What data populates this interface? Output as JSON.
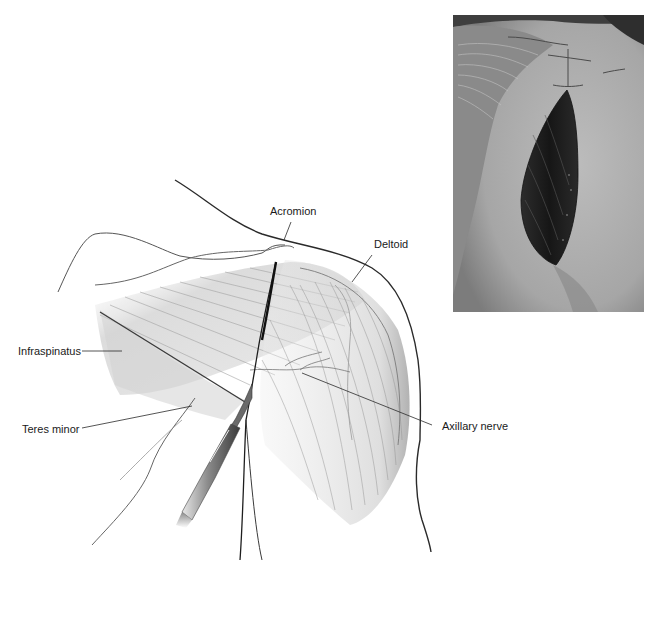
{
  "figure": {
    "type": "anatomical-illustration",
    "labels": {
      "acromion": "Acromion",
      "deltoid": "Deltoid",
      "infraspinatus": "Infraspinatus",
      "teres_minor": "Teres minor",
      "axillary_nerve": "Axillary nerve"
    },
    "instrument": "scalpel",
    "photo": {
      "subject": "clinical photograph of posterior shoulder incision",
      "tone": "grayscale"
    },
    "colors": {
      "line": "#2a2a2a",
      "muscle_shade": "#b8b8b8",
      "label_text": "#1a1a1a",
      "photo_skin": "#a9a9a9",
      "photo_wound": "#1e1e1e"
    }
  }
}
